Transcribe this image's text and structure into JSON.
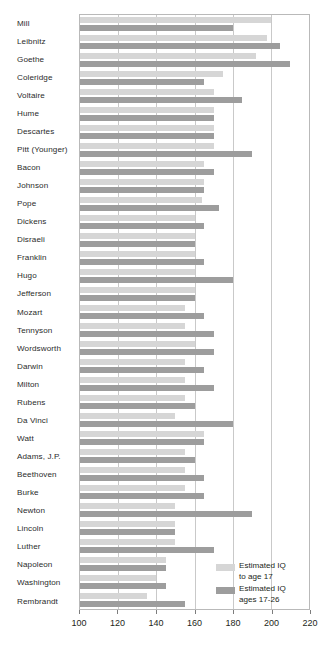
{
  "chart_data": {
    "type": "bar",
    "orientation": "horizontal",
    "title": "",
    "subtitle": "",
    "xlabel": "",
    "ylabel": "",
    "xlim": [
      100,
      220
    ],
    "xticks": [
      100,
      120,
      140,
      160,
      180,
      200,
      220
    ],
    "grid": true,
    "legend_position": "bottom-right",
    "colors": {
      "series_a": "#d6d6d6",
      "series_b": "#9d9d9d",
      "axis": "#b9b9b9",
      "gridline": "#c9c9c9",
      "text": "#231f20"
    },
    "categories": [
      "Mill",
      "Leibnitz",
      "Goethe",
      "Coleridge",
      "Voltaire",
      "Hume",
      "Descartes",
      "Pitt (Younger)",
      "Bacon",
      "Johnson",
      "Pope",
      "Dickens",
      "Disraeli",
      "Franklin",
      "Hugo",
      "Jefferson",
      "Mozart",
      "Tennyson",
      "Wordsworth",
      "Darwin",
      "Milton",
      "Rubens",
      "Da Vinci",
      "Watt",
      "Adams, J.P.",
      "Beethoven",
      "Burke",
      "Newton",
      "Lincoln",
      "Luther",
      "Napoleon",
      "Washington",
      "Rembrandt"
    ],
    "series": [
      {
        "name": "Estimated IQ to age 17",
        "key": "series_a",
        "values": [
          200,
          198,
          192,
          175,
          170,
          170,
          170,
          170,
          165,
          165,
          164,
          160,
          160,
          160,
          160,
          160,
          155,
          155,
          160,
          155,
          155,
          155,
          150,
          165,
          155,
          155,
          155,
          150,
          150,
          150,
          145,
          140,
          135
        ]
      },
      {
        "name": "Estimated IQ ages 17-26",
        "key": "series_b",
        "values": [
          180,
          205,
          210,
          165,
          185,
          170,
          170,
          190,
          170,
          165,
          173,
          165,
          160,
          165,
          180,
          160,
          165,
          170,
          170,
          165,
          170,
          160,
          180,
          165,
          160,
          165,
          165,
          190,
          150,
          170,
          145,
          145,
          155
        ]
      }
    ]
  },
  "legend": {
    "items": [
      {
        "label": "Estimated IQ\nto age 17",
        "swatch": "series-a"
      },
      {
        "label": "Estimated IQ\nages 17-26",
        "swatch": "series-b"
      }
    ]
  }
}
